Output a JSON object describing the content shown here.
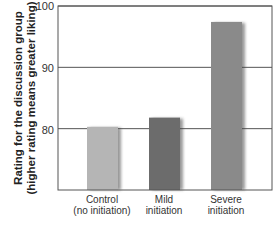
{
  "chart_data": {
    "type": "bar",
    "title": "",
    "xlabel": "",
    "ylabel": "Rating for the discussion group (higher rating means greater liking)",
    "ylabel_lines": [
      "Rating for the discussion group",
      "(higher rating means greater liking)"
    ],
    "categories": [
      "Control (no initiation)",
      "Mild initiation",
      "Severe initiation"
    ],
    "category_lines": [
      [
        "Control",
        "(no initiation)"
      ],
      [
        "Mild",
        "initiation"
      ],
      [
        "Severe",
        "initiation"
      ]
    ],
    "values": [
      80.3,
      81.8,
      97.4
    ],
    "colors": [
      "#b5b5b5",
      "#6c6c6c",
      "#8a8a8a"
    ],
    "ylim": [
      70,
      100
    ],
    "yticks": [
      80,
      90,
      100
    ],
    "ytick_labels": [
      "80",
      "90",
      "100"
    ],
    "grid": true,
    "legend": null
  }
}
